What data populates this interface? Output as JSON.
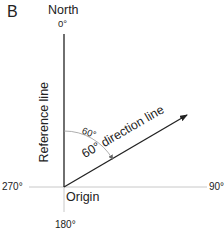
{
  "panel_label": "B",
  "north_label": "North",
  "angles": {
    "top": "0°",
    "right": "90°",
    "bottom": "180°",
    "left": "270°"
  },
  "reference_line_label": "Reference line",
  "direction_line_label": "60° direction line",
  "arc_label": "60°",
  "origin_label": "Origin",
  "colors": {
    "main_line": "#222222",
    "axis_line": "#bfbfbf",
    "arc": "#999999",
    "text": "#222222"
  }
}
